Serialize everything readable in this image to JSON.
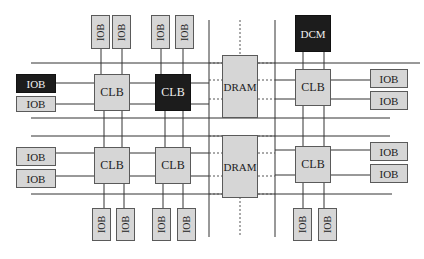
{
  "diagram": {
    "colors": {
      "block_fill": "#d6d6d6",
      "highlight_fill": "#1c1c1c",
      "line": "#333333"
    },
    "top_iobs": [
      {
        "label": "IOB"
      },
      {
        "label": "IOB"
      },
      {
        "label": "IOB"
      },
      {
        "label": "IOB"
      }
    ],
    "dcm": {
      "label": "DCM"
    },
    "left_iobs": [
      {
        "label": "IOB",
        "highlighted": true
      },
      {
        "label": "IOB"
      },
      {
        "label": "IOB"
      },
      {
        "label": "IOB"
      }
    ],
    "clbs": [
      {
        "label": "CLB"
      },
      {
        "label": "CLB",
        "highlighted": true
      },
      {
        "label": "CLB"
      },
      {
        "label": "CLB"
      },
      {
        "label": "CLB"
      },
      {
        "label": "CLB"
      }
    ],
    "drams": [
      {
        "label": "DRAM"
      },
      {
        "label": "DRAM"
      }
    ],
    "right_iobs": [
      {
        "label": "IOB"
      },
      {
        "label": "IOB"
      },
      {
        "label": "IOB"
      },
      {
        "label": "IOB"
      }
    ],
    "bottom_iobs": [
      {
        "label": "IOB"
      },
      {
        "label": "IOB"
      },
      {
        "label": "IOB"
      },
      {
        "label": "IOB"
      },
      {
        "label": "IOB"
      },
      {
        "label": "IOB"
      }
    ]
  }
}
